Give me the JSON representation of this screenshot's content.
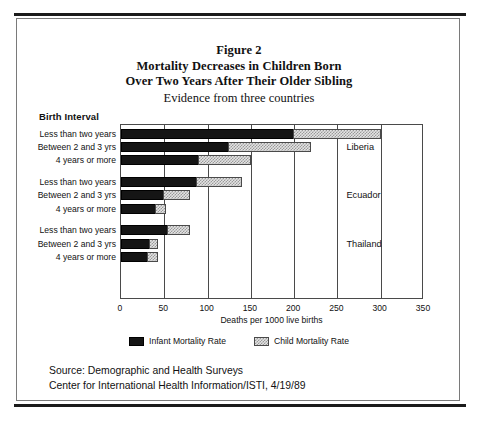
{
  "figure": {
    "title_lines": [
      "Figure 2",
      "Mortality Decreases in Children Born",
      "Over Two Years After Their Older Sibling"
    ],
    "subtitle": "Evidence from three countries",
    "axis_group_heading": "Birth Interval",
    "source_lines": [
      "Source: Demographic and Health Surveys",
      "Center for International Health Information/ISTI, 4/19/89"
    ]
  },
  "colors": {
    "infant": "#151515",
    "child": "#e3e3e3",
    "frame": "#4a4a4a",
    "page_rule": "#1b1b1b"
  },
  "legend": {
    "position": "bottom-center",
    "items": [
      {
        "label": "Infant Mortality Rate",
        "swatch": "infant-swatch"
      },
      {
        "label": "Child Mortality Rate",
        "swatch": "child-swatch"
      }
    ]
  },
  "chart_data": {
    "type": "bar",
    "orientation": "horizontal",
    "stacked": true,
    "title": "Mortality Decreases in Children Born Over Two Years After Their Older Sibling",
    "subtitle": "Evidence from three countries",
    "xlabel": "Deaths per 1000 live births",
    "ylabel": "Birth Interval",
    "xlim": [
      0,
      350
    ],
    "xticks": [
      0,
      50,
      100,
      150,
      200,
      250,
      300,
      350
    ],
    "xtick_labels": [
      "0",
      "50",
      "100",
      "150",
      "200",
      "250",
      "300",
      "350"
    ],
    "grid": true,
    "categories": [
      "Less than two years",
      "Between 2 and 3 yrs",
      "4 years or more"
    ],
    "series": [
      {
        "name": "Infant Mortality Rate",
        "key": "infant"
      },
      {
        "name": "Child Mortality Rate",
        "key": "child"
      }
    ],
    "groups": [
      {
        "country": "Liberia",
        "bars": [
          {
            "category": "Less than two years",
            "infant": 200,
            "child": 100,
            "total": 300
          },
          {
            "category": "Between 2 and 3 yrs",
            "infant": 125,
            "child": 95,
            "total": 220
          },
          {
            "category": "4 years or more",
            "infant": 90,
            "child": 60,
            "total": 150
          }
        ]
      },
      {
        "country": "Ecuador",
        "bars": [
          {
            "category": "Less than two years",
            "infant": 88,
            "child": 52,
            "total": 140
          },
          {
            "category": "Between 2 and 3 yrs",
            "infant": 50,
            "child": 30,
            "total": 80
          },
          {
            "category": "4 years or more",
            "infant": 40,
            "child": 12,
            "total": 52
          }
        ]
      },
      {
        "country": "Thailand",
        "bars": [
          {
            "category": "Less than two years",
            "infant": 54,
            "child": 26,
            "total": 80
          },
          {
            "category": "Between 2 and 3 yrs",
            "infant": 34,
            "child": 9,
            "total": 43
          },
          {
            "category": "4 years or more",
            "infant": 31,
            "child": 12,
            "total": 43
          }
        ]
      }
    ]
  }
}
